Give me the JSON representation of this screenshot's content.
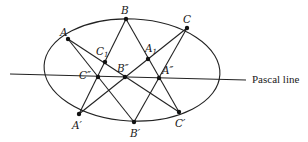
{
  "diagram": {
    "type": "Pascal's theorem (hexagon inscribed in a conic)",
    "stroke_color": "#222222",
    "conic": {
      "shape": "ellipse",
      "cx": 132,
      "cy": 70,
      "rx": 88,
      "ry": 51,
      "rotate_deg": 3
    },
    "points": {
      "A": {
        "label": "A",
        "x": 68,
        "y": 39
      },
      "B": {
        "label": "B",
        "x": 126,
        "y": 19
      },
      "C": {
        "label": "C",
        "x": 187,
        "y": 28
      },
      "Ap": {
        "label": "A′",
        "x": 79,
        "y": 114
      },
      "Bp": {
        "label": "B′",
        "x": 134,
        "y": 122
      },
      "Cp": {
        "label": "C′",
        "x": 179,
        "y": 112
      },
      "C1": {
        "label": "C1",
        "x": 105,
        "y": 62
      },
      "A1": {
        "label": "A1",
        "x": 148,
        "y": 59
      },
      "Cpp": {
        "label": "C″",
        "x": 98,
        "y": 77
      },
      "Bpp": {
        "label": "B″",
        "x": 125,
        "y": 77
      },
      "App": {
        "label": "A″",
        "x": 159,
        "y": 78
      }
    },
    "pascal_line": {
      "label": "Pascal line",
      "x1": 10,
      "y1": 74,
      "x2": 246,
      "y2": 80
    },
    "segments": [
      [
        "A",
        "Bp"
      ],
      [
        "A",
        "Cp"
      ],
      [
        "B",
        "Ap"
      ],
      [
        "B",
        "Cp"
      ],
      [
        "C",
        "Ap"
      ],
      [
        "C",
        "Bp"
      ]
    ]
  }
}
